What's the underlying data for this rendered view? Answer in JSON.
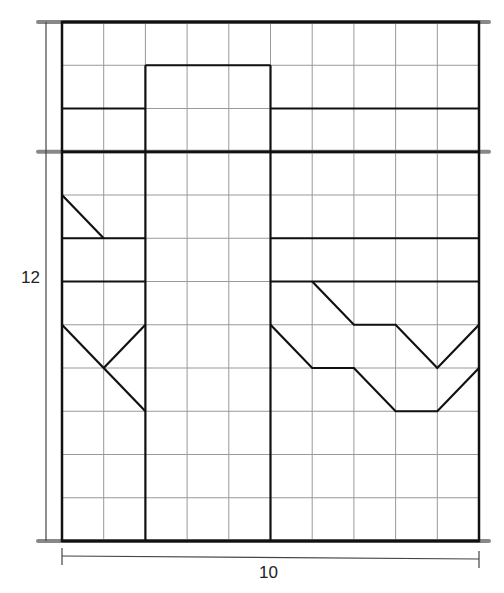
{
  "diagram": {
    "grid": {
      "cols": 10,
      "rows": 12,
      "left": 62,
      "top": 22,
      "right": 479,
      "bottom": 541
    },
    "dimension_labels": {
      "height": "12",
      "width": "10"
    },
    "colors": {
      "grid": "#999999",
      "outline": "#111111",
      "band": "#888888",
      "dim": "#444444"
    },
    "band_rows": [
      0,
      3,
      12
    ],
    "segments": [
      {
        "name": "center-rect-left",
        "pts": [
          [
            2,
            12
          ],
          [
            2,
            1
          ]
        ]
      },
      {
        "name": "center-rect-top",
        "pts": [
          [
            2,
            1
          ],
          [
            5,
            1
          ]
        ]
      },
      {
        "name": "center-rect-right",
        "pts": [
          [
            5,
            1
          ],
          [
            5,
            12
          ]
        ]
      },
      {
        "name": "left-shelf-row2",
        "pts": [
          [
            0,
            2
          ],
          [
            2,
            2
          ]
        ]
      },
      {
        "name": "right-shelf-row2",
        "pts": [
          [
            5,
            2
          ],
          [
            10,
            2
          ]
        ]
      },
      {
        "name": "left-diagonal-top",
        "pts": [
          [
            0,
            4
          ],
          [
            1,
            5
          ]
        ]
      },
      {
        "name": "left-shelf-row5",
        "pts": [
          [
            0,
            5
          ],
          [
            2,
            5
          ]
        ]
      },
      {
        "name": "left-shelf-row6",
        "pts": [
          [
            0,
            6
          ],
          [
            2,
            6
          ]
        ]
      },
      {
        "name": "left-x-diag-a",
        "pts": [
          [
            0,
            7
          ],
          [
            1,
            8
          ],
          [
            2,
            9
          ]
        ]
      },
      {
        "name": "left-x-diag-b",
        "pts": [
          [
            2,
            7
          ],
          [
            1,
            8
          ]
        ]
      },
      {
        "name": "right-shelf-row5",
        "pts": [
          [
            5,
            5
          ],
          [
            10,
            5
          ]
        ]
      },
      {
        "name": "right-shelf-row6",
        "pts": [
          [
            5,
            6
          ],
          [
            10,
            6
          ]
        ]
      },
      {
        "name": "right-zigzag-upper",
        "pts": [
          [
            6,
            6
          ],
          [
            7,
            7
          ],
          [
            8,
            7
          ],
          [
            9,
            8
          ],
          [
            10,
            7
          ]
        ]
      },
      {
        "name": "right-zigzag-lower",
        "pts": [
          [
            5,
            7
          ],
          [
            6,
            8
          ],
          [
            7,
            8
          ],
          [
            8,
            9
          ],
          [
            9,
            9
          ],
          [
            10,
            8
          ]
        ]
      }
    ]
  }
}
